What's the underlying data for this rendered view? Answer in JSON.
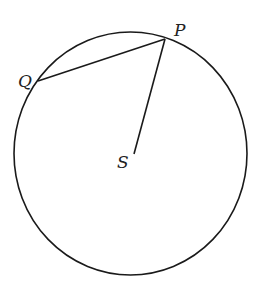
{
  "diagram": {
    "type": "geometry",
    "colors": {
      "stroke": "#1a1a1a",
      "label": "#222222",
      "background": "#ffffff"
    },
    "circle": {
      "cx": 130.5,
      "cy": 153.5,
      "rx": 116.5,
      "ry": 121.5
    },
    "points": {
      "P": {
        "label": "P",
        "x": 165,
        "y": 39,
        "label_x": 174,
        "label_y": 36
      },
      "Q": {
        "label": "Q",
        "x": 38,
        "y": 81,
        "label_x": 18,
        "label_y": 87
      },
      "S": {
        "label": "S",
        "x": 134,
        "y": 154,
        "label_x": 117,
        "label_y": 168
      }
    },
    "segments": [
      {
        "name": "chord-QP",
        "from": "Q",
        "to": "P"
      },
      {
        "name": "segment-SP",
        "from": "S",
        "to": "P"
      }
    ]
  }
}
